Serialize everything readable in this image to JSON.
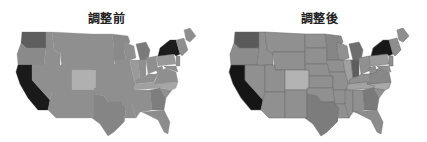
{
  "panels": [
    {
      "title": "調整前",
      "colors": {
        "base": "#8f8f8f",
        "WA": "#5e5e5e",
        "OR": "#8a8a8a",
        "CA": "#1a1a1a",
        "CO": "#b0b0b0",
        "NY": "#1c1c1c",
        "ME": "#8e8e8e",
        "MN": "#8a8a8a",
        "MI": "#7a7a7a",
        "TX": "#858585",
        "FL": "#8c8c8c",
        "NC": "#a6a6a6",
        "TN": "#a0a0a0",
        "PA": "#999999",
        "VA": "#8f8f8f",
        "IL": "#9a9a9a",
        "GA": "#7e7e7e"
      }
    },
    {
      "title": "調整後",
      "colors": {
        "base": "#909090",
        "WA": "#5a5a5a",
        "OR": "#8c8c8c",
        "CA": "#151515",
        "CO": "#b3b3b3",
        "NY": "#181818",
        "ME": "#8e8e8e",
        "MN": "#868686",
        "MI": "#6e6e6e",
        "TX": "#7c7c7c",
        "FL": "#8c8c8c",
        "NC": "#a9a9a9",
        "TN": "#a3a3a3",
        "PA": "#9c9c9c",
        "VA": "#888888",
        "IL": "#a0a0a0",
        "IN": "#5e5e5e",
        "GA": "#7a7a7a"
      }
    }
  ]
}
